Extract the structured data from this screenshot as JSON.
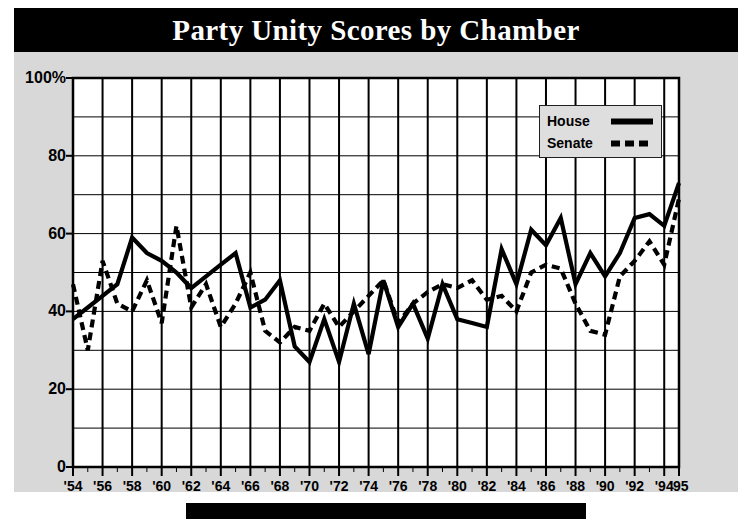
{
  "figure": {
    "title": "Party Unity Scores by Chamber",
    "title_background": "#000000",
    "title_color": "#ffffff",
    "panel_background": "#d8d8d8",
    "footer_bar_color": "#000000"
  },
  "legend": {
    "position": "top-right-inside",
    "entries": [
      {
        "label": "House",
        "style": "solid",
        "color": "#000000"
      },
      {
        "label": "Senate",
        "style": "dashed",
        "color": "#000000"
      }
    ]
  },
  "chart_data": {
    "type": "line",
    "title": "Party Unity Scores by Chamber",
    "xlabel": "",
    "ylabel": "",
    "ylim": [
      0,
      100
    ],
    "xlim": [
      1954,
      1995
    ],
    "grid": true,
    "y_ticks": [
      0,
      20,
      40,
      60,
      80,
      100
    ],
    "y_tick_labels": [
      "0",
      "20",
      "40",
      "60",
      "80",
      "100%"
    ],
    "x_ticks": [
      1954,
      1956,
      1958,
      1960,
      1962,
      1964,
      1966,
      1968,
      1970,
      1972,
      1974,
      1976,
      1978,
      1980,
      1982,
      1984,
      1986,
      1988,
      1990,
      1992,
      1994,
      1995
    ],
    "x_tick_labels": [
      "'54",
      "'56",
      "'58",
      "'60",
      "'62",
      "'64",
      "'66",
      "'68",
      "'70",
      "'72",
      "'74",
      "'76",
      "'78",
      "'80",
      "'82",
      "'84",
      "'86",
      "'88",
      "'90",
      "'92",
      "'94",
      "'95"
    ],
    "x": [
      1954,
      1955,
      1956,
      1957,
      1958,
      1959,
      1960,
      1961,
      1962,
      1963,
      1964,
      1965,
      1966,
      1967,
      1968,
      1969,
      1970,
      1971,
      1972,
      1973,
      1974,
      1975,
      1976,
      1977,
      1978,
      1979,
      1980,
      1981,
      1982,
      1983,
      1984,
      1985,
      1986,
      1987,
      1988,
      1989,
      1990,
      1991,
      1992,
      1993,
      1994,
      1995
    ],
    "series": [
      {
        "name": "House",
        "style": "solid",
        "color": "#000000",
        "values": [
          38,
          41,
          44,
          47,
          59,
          55,
          53,
          50,
          46,
          49,
          52,
          55,
          41,
          43,
          48,
          31,
          27,
          38,
          27,
          42,
          29,
          48,
          36,
          42,
          33,
          47,
          38,
          37,
          36,
          56,
          47,
          61,
          57,
          64,
          47,
          55,
          49,
          55,
          64,
          65,
          62,
          73
        ],
        "value_range": [
          27,
          73
        ]
      },
      {
        "name": "Senate",
        "style": "dashed",
        "color": "#000000",
        "values": [
          47,
          30,
          53,
          42,
          40,
          48,
          37,
          62,
          41,
          47,
          36,
          42,
          50,
          35,
          32,
          36,
          35,
          42,
          36,
          40,
          44,
          48,
          37,
          42,
          45,
          47,
          46,
          48,
          43,
          44,
          40,
          50,
          52,
          51,
          42,
          35,
          34,
          49,
          53,
          58,
          52,
          69
        ],
        "value_range": [
          30,
          69
        ]
      }
    ]
  }
}
